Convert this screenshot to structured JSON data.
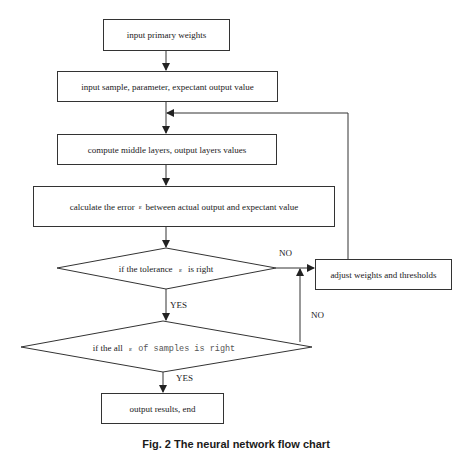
{
  "flowchart": {
    "nodes": {
      "input_weights": "input primary weights",
      "input_sample": "input sample, parameter, expectant output value",
      "compute_layers": "compute middle layers, output layers values",
      "calc_error_pre": "calculate the error",
      "calc_error_eps": "ε",
      "calc_error_post": "between actual output and expectant value",
      "decision_tolerance_pre": "if the tolerance",
      "decision_tolerance_eps": "ε",
      "decision_tolerance_post": "is right",
      "decision_all_pre": "if the all",
      "decision_all_eps": "ε",
      "decision_all_post": "of samples is right",
      "adjust": "adjust weights and thresholds",
      "output": "output results, end"
    },
    "edge_labels": {
      "tolerance_no": "NO",
      "tolerance_yes": "YES",
      "all_no": "NO",
      "all_yes": "YES"
    }
  },
  "caption": "Fig. 2  The neural network flow chart"
}
